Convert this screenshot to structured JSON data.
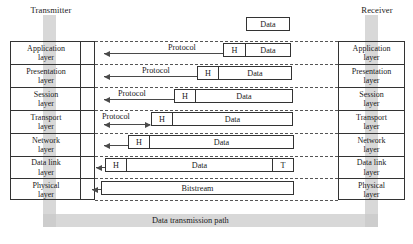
{
  "diagram": {
    "transmitter_label": "Transmitter",
    "receiver_label": "Receiver",
    "bottom_label": "Data transmission path",
    "protocol_label": "Protocol",
    "header_label": "H",
    "trailer_label": "T",
    "data_label": "Data",
    "bitstream_label": "Bitstream",
    "layers": [
      {
        "name": "Application\nlayer"
      },
      {
        "name": "Presentation\nlayer"
      },
      {
        "name": "Session\nlayer"
      },
      {
        "name": "Transport\nlayer"
      },
      {
        "name": "Network\nlayer"
      },
      {
        "name": "Data link\nlayer"
      },
      {
        "name": "Physical\nlayer"
      }
    ],
    "pdus": [
      {
        "layer": "top",
        "cells": [
          "Data"
        ]
      },
      {
        "layer": "Application",
        "cells": [
          "H",
          "Data"
        ]
      },
      {
        "layer": "Presentation",
        "cells": [
          "H",
          "Data"
        ]
      },
      {
        "layer": "Session",
        "cells": [
          "H",
          "Data"
        ]
      },
      {
        "layer": "Transport",
        "cells": [
          "H",
          "Data"
        ]
      },
      {
        "layer": "Network",
        "cells": [
          "H",
          "Data"
        ]
      },
      {
        "layer": "Data link",
        "cells": [
          "H",
          "Data",
          "T"
        ]
      },
      {
        "layer": "Physical",
        "cells": [
          "Bitstream"
        ]
      }
    ],
    "colors": {
      "band": "#c9c9c9",
      "line": "#333333",
      "arrow": "#4a4a4a",
      "background": "#ffffff"
    }
  }
}
